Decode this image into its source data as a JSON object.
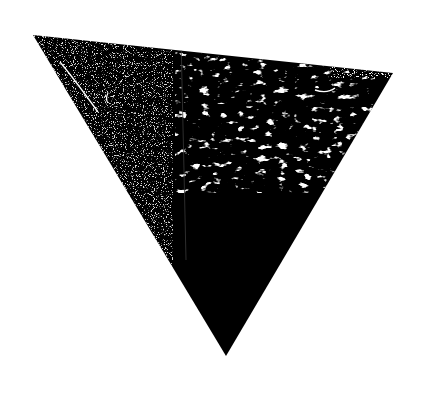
{
  "image": {
    "subject": "inverted-triangle",
    "description": "Black inverted triangle with distressed, grungy white texture",
    "background_color": "#ffffff",
    "fill_color": "#000000",
    "texture_color": "#ffffff",
    "vertices": {
      "top_left": [
        33,
        35
      ],
      "top_right": [
        393,
        73
      ],
      "bottom": [
        226,
        356
      ]
    }
  }
}
